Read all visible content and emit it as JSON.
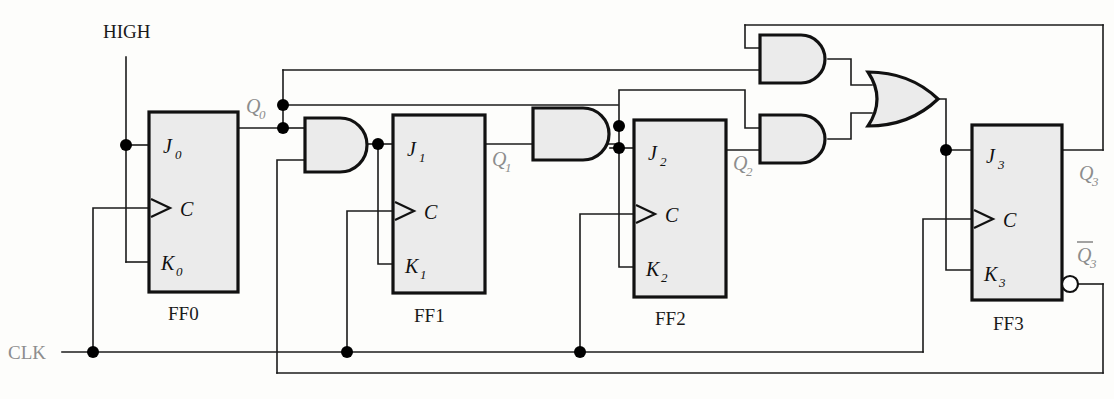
{
  "diagram": {
    "inputs": [
      {
        "id": "high",
        "label": "HIGH",
        "color": "#1a1a1a"
      },
      {
        "id": "clk",
        "label": "CLK",
        "color": "#8d8d8d"
      }
    ],
    "flipflops": [
      {
        "name": "FF0",
        "j": "J",
        "j_sub": "0",
        "c": "C",
        "k": "K",
        "k_sub": "0",
        "q": "Q",
        "q_sub": "0"
      },
      {
        "name": "FF1",
        "j": "J",
        "j_sub": "1",
        "c": "C",
        "k": "K",
        "k_sub": "1",
        "q": "Q",
        "q_sub": "1"
      },
      {
        "name": "FF2",
        "j": "J",
        "j_sub": "2",
        "c": "C",
        "k": "K",
        "k_sub": "2",
        "q": "Q",
        "q_sub": "2"
      },
      {
        "name": "FF3",
        "j": "J",
        "j_sub": "3",
        "c": "C",
        "k": "K",
        "k_sub": "3",
        "q": "Q",
        "q_sub": "3",
        "qnot": "Q",
        "qnot_sub": "3"
      }
    ],
    "gates": [
      {
        "id": "and1",
        "type": "AND",
        "inputs": 2
      },
      {
        "id": "and2",
        "type": "AND",
        "inputs": 2
      },
      {
        "id": "and3",
        "type": "AND",
        "inputs": 2
      },
      {
        "id": "and4",
        "type": "AND",
        "inputs": 2
      },
      {
        "id": "or1",
        "type": "OR",
        "inputs": 2
      }
    ],
    "colors": {
      "wire": "#1b1b1b",
      "gate_fill": "#ebebeb",
      "gate_stroke": "#111111",
      "signal_label": "#8d8d8d",
      "pin_label": "#111111",
      "background": "#fdfdfb"
    }
  }
}
